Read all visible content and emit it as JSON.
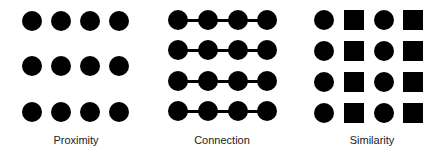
{
  "panels": [
    {
      "name": "proximity",
      "label": "Proximity",
      "label_center_x": 76,
      "label_top": 134,
      "shape_size": 20,
      "columns_x": [
        32,
        61,
        90,
        119
      ],
      "rows_y": [
        21,
        66,
        112
      ],
      "pattern": [
        [
          "circle",
          "circle",
          "circle",
          "circle"
        ],
        [
          "circle",
          "circle",
          "circle",
          "circle"
        ],
        [
          "circle",
          "circle",
          "circle",
          "circle"
        ]
      ],
      "connected": false
    },
    {
      "name": "connection",
      "label": "Connection",
      "label_center_x": 222,
      "label_top": 134,
      "shape_size": 20,
      "columns_x": [
        178,
        208,
        238,
        267
      ],
      "rows_y": [
        20,
        50,
        81,
        111
      ],
      "pattern": [
        [
          "circle",
          "circle",
          "circle",
          "circle"
        ],
        [
          "circle",
          "circle",
          "circle",
          "circle"
        ],
        [
          "circle",
          "circle",
          "circle",
          "circle"
        ],
        [
          "circle",
          "circle",
          "circle",
          "circle"
        ]
      ],
      "connected": true
    },
    {
      "name": "similarity",
      "label": "Similarity",
      "label_center_x": 372,
      "label_top": 134,
      "shape_size": 20,
      "columns_x": [
        324,
        354,
        384,
        413
      ],
      "rows_y": [
        20,
        51,
        82,
        113
      ],
      "pattern": [
        [
          "circle",
          "square",
          "circle",
          "square"
        ],
        [
          "circle",
          "square",
          "circle",
          "square"
        ],
        [
          "circle",
          "square",
          "circle",
          "square"
        ],
        [
          "circle",
          "square",
          "circle",
          "square"
        ]
      ],
      "connected": false
    }
  ],
  "colors": {
    "shape": "#000000",
    "label": "#222222",
    "background": "#ffffff"
  }
}
